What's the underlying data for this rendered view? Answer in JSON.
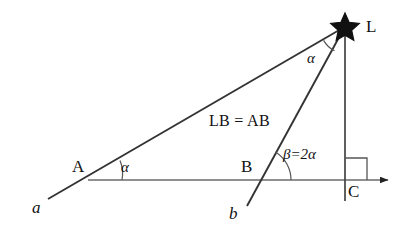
{
  "diagram": {
    "stroke_color": "#222222",
    "background_color": "#ffffff",
    "star": {
      "icon": "star-icon",
      "label": "L",
      "cx": 345,
      "cy": 26
    },
    "points": [
      {
        "name": "A",
        "label": "A",
        "x": 88,
        "y": 180,
        "label_x": 72,
        "label_y": 160
      },
      {
        "name": "B",
        "label": "B",
        "x": 258,
        "y": 180,
        "label_x": 241,
        "label_y": 160
      },
      {
        "name": "C",
        "label": "C",
        "x": 345,
        "y": 180,
        "label_x": 348,
        "label_y": 183
      }
    ],
    "rays": [
      {
        "name": "ray-a",
        "label": "a",
        "label_x": 32,
        "label_y": 200,
        "from_x": 48,
        "from_y": 199,
        "to_x": 345,
        "to_y": 26
      },
      {
        "name": "ray-b",
        "label": "b",
        "label_x": 229,
        "label_y": 206,
        "from_x": 247,
        "from_y": 206,
        "to_x": 345,
        "to_y": 26
      }
    ],
    "baseline": {
      "name": "horizontal-baseline",
      "from_x": 88,
      "from_y": 180,
      "to_x": 390,
      "to_y": 180,
      "arrow": "arrow-right"
    },
    "vertical": {
      "name": "vertical-line-LC",
      "from_x": 345,
      "from_y": 26,
      "to_x": 345,
      "to_y": 201
    },
    "right_angle": {
      "name": "right-angle-marker-C",
      "x": 345,
      "y": 180,
      "size": 22
    },
    "angles": [
      {
        "name": "angle-at-A",
        "label": "α",
        "label_x": 121,
        "label_y": 161,
        "vertex_x": 88,
        "vertex_y": 180,
        "radius": 34
      },
      {
        "name": "angle-at-L",
        "label": "α",
        "label_x": 307,
        "label_y": 52,
        "vertex_x": 345,
        "vertex_y": 26,
        "radius": 26
      },
      {
        "name": "angle-at-B",
        "label": "β=2α",
        "label_x": 283,
        "label_y": 148,
        "vertex_x": 258,
        "vertex_y": 180,
        "radius": 33
      }
    ],
    "annotations": [
      {
        "name": "segment-equality-note",
        "text": "LB = AB",
        "x": 209,
        "y": 114
      }
    ]
  }
}
